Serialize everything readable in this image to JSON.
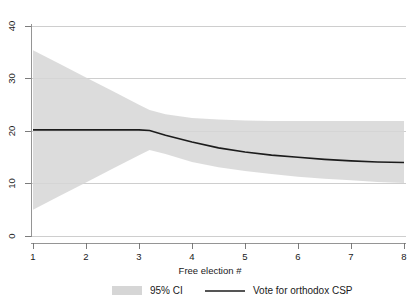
{
  "chart_data": {
    "type": "line",
    "title": "",
    "subtitle": "",
    "xlabel": "Free election #",
    "ylabel": "",
    "xlim": [
      1,
      8
    ],
    "ylim": [
      0,
      42
    ],
    "grid": true,
    "legend_position": "bottom",
    "x_ticks": [
      "1",
      "2",
      "3",
      "4",
      "5",
      "6",
      "7",
      "8"
    ],
    "x_tick_values": [
      1,
      2,
      3,
      4,
      5,
      6,
      7,
      8
    ],
    "y_ticks": [
      "0",
      "10",
      "20",
      "30",
      "40"
    ],
    "y_tick_values": [
      0,
      10,
      20,
      30,
      40
    ],
    "series": [
      {
        "name": "Vote  for orthodox CSP",
        "kind": "line",
        "color": "#1c1c1c",
        "x": [
          1,
          1.5,
          2,
          2.5,
          3,
          3.2,
          3.5,
          4,
          4.5,
          5,
          5.5,
          6,
          6.5,
          7,
          7.5,
          8
        ],
        "values": [
          20.2,
          20.2,
          20.2,
          20.2,
          20.2,
          20.1,
          19.2,
          17.9,
          16.8,
          16.0,
          15.4,
          15.0,
          14.6,
          14.3,
          14.1,
          14.0
        ]
      },
      {
        "name": "95% CI",
        "kind": "band",
        "color": "#d6d6d6",
        "x": [
          1,
          1.5,
          2,
          2.5,
          3,
          3.2,
          3.5,
          4,
          4.5,
          5,
          5.5,
          6,
          6.5,
          7,
          7.5,
          8
        ],
        "upper": [
          35.4,
          32.8,
          30.2,
          27.6,
          25.0,
          24.0,
          23.2,
          22.5,
          22.2,
          22.0,
          21.9,
          21.9,
          21.9,
          21.9,
          21.9,
          21.9
        ],
        "lower": [
          5.0,
          7.6,
          10.2,
          12.8,
          15.4,
          16.4,
          15.6,
          14.1,
          13.1,
          12.4,
          11.8,
          11.3,
          10.9,
          10.6,
          10.3,
          10.1
        ]
      }
    ]
  },
  "legend": {
    "items": [
      {
        "label": "95% CI",
        "marker": "swatch"
      },
      {
        "label": "Vote  for orthodox CSP",
        "marker": "line"
      }
    ]
  },
  "axes": {
    "x_title": "Free election #"
  }
}
